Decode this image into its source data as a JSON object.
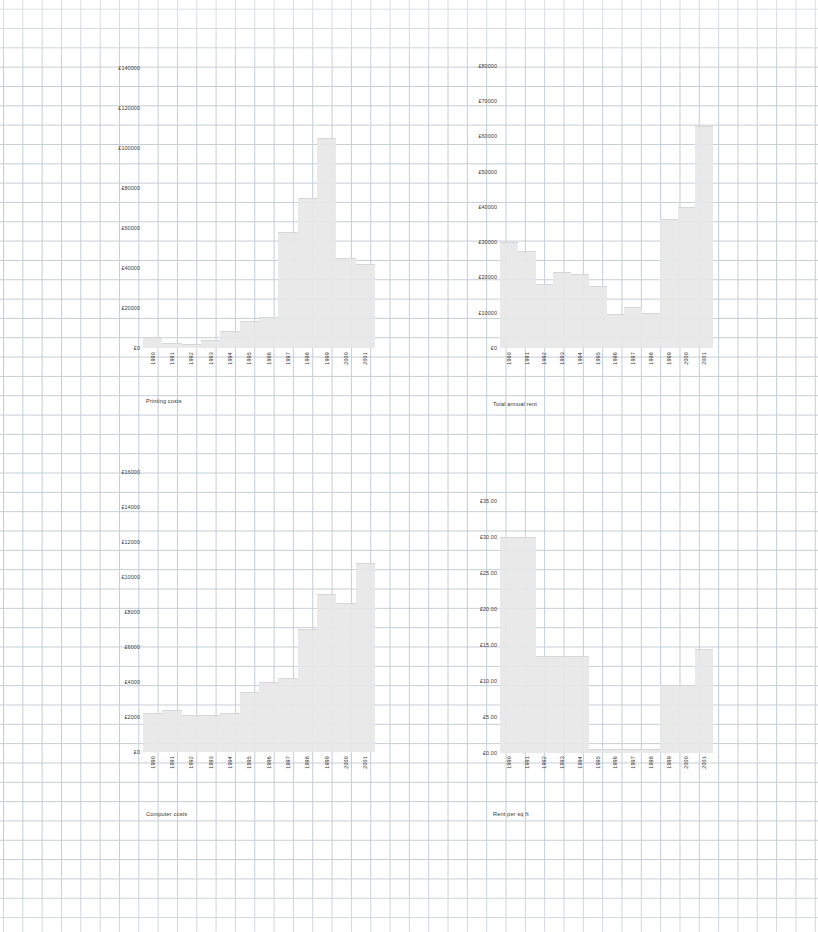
{
  "page": {
    "background": "#ffffff",
    "grid_color": "#b9c4cf",
    "bar_fill": "#e8e8e8",
    "bar_stroke": "#d4d4d4",
    "text_color": "#3a3a3a"
  },
  "charts": [
    {
      "id": "printing-costs",
      "caption": "Printing costs",
      "type": "bar",
      "title": "Printing costs",
      "xlabel": "",
      "ylabel": "",
      "ylim": [
        0,
        150000
      ],
      "ytick_values": [
        0,
        20000,
        40000,
        60000,
        80000,
        100000,
        120000,
        140000
      ],
      "ytick_labels": [
        "£0",
        "£20000",
        "£40000",
        "£60000",
        "£80000",
        "£100000",
        "£120000",
        "£140000"
      ],
      "categories": [
        "1990",
        "1991",
        "1992",
        "1993",
        "1994",
        "1995",
        "1996",
        "1997",
        "1998",
        "1999",
        "2000",
        "2001"
      ],
      "values": [
        5500,
        2600,
        1800,
        4200,
        8500,
        13500,
        15500,
        58000,
        75000,
        105000,
        45000,
        42000
      ],
      "grid": true,
      "legend": "none"
    },
    {
      "id": "total-annual-rent",
      "caption": "Total annual rent",
      "type": "bar",
      "title": "Total annual rent",
      "xlabel": "",
      "ylabel": "",
      "ylim": [
        0,
        85000
      ],
      "ytick_values": [
        0,
        10000,
        20000,
        30000,
        40000,
        50000,
        60000,
        70000,
        80000
      ],
      "ytick_labels": [
        "£0",
        "£10000",
        "£20000",
        "£30000",
        "£40000",
        "£50000",
        "£60000",
        "£70000",
        "£80000"
      ],
      "categories": [
        "1990",
        "1991",
        "1992",
        "1993",
        "1994",
        "1995",
        "1996",
        "1997",
        "1998",
        "1999",
        "2000",
        "2001"
      ],
      "values": [
        30000,
        27500,
        18000,
        21500,
        21000,
        17500,
        9500,
        11500,
        10000,
        36500,
        40000,
        63000
      ],
      "grid": true,
      "legend": "none"
    },
    {
      "id": "computer-costs",
      "caption": "Computer costs",
      "type": "bar",
      "title": "Computer costs",
      "xlabel": "",
      "ylabel": "",
      "ylim": [
        0,
        17000
      ],
      "ytick_values": [
        0,
        2000,
        4000,
        6000,
        8000,
        10000,
        12000,
        14000,
        16000
      ],
      "ytick_labels": [
        "£0",
        "£2000",
        "£4000",
        "£6000",
        "£8000",
        "£10000",
        "£12000",
        "£14000",
        "£16000"
      ],
      "categories": [
        "1990",
        "1991",
        "1992",
        "1993",
        "1994",
        "1995",
        "1996",
        "1997",
        "1998",
        "1999",
        "2000",
        "2001"
      ],
      "values": [
        2200,
        2400,
        2100,
        2100,
        2250,
        3400,
        4000,
        4200,
        7000,
        9000,
        8500,
        10800
      ],
      "grid": true,
      "legend": "none"
    },
    {
      "id": "rent-per-sq-ft",
      "caption": "Rent per sq ft",
      "type": "bar",
      "title": "Rent per sq ft",
      "xlabel": "",
      "ylabel": "",
      "ylim": [
        0,
        37.5
      ],
      "ytick_values": [
        0,
        5,
        10,
        15,
        20,
        25,
        30,
        35
      ],
      "ytick_labels": [
        "£0.00",
        "£5.00",
        "£10.00",
        "£15.00",
        "£20.00",
        "£25.00",
        "£30.00",
        "£35.00"
      ],
      "categories": [
        "1990",
        "1991",
        "1992",
        "1993",
        "1994",
        "1995",
        "1996",
        "1997",
        "1998",
        "1999",
        "2000",
        "2001"
      ],
      "values": [
        30.0,
        30.0,
        13.5,
        13.5,
        13.5,
        0.6,
        0.6,
        0.6,
        0.6,
        9.5,
        9.5,
        14.5
      ],
      "grid": true,
      "legend": "none"
    }
  ],
  "chart_data": [
    {
      "type": "bar",
      "title": "Printing costs",
      "xlabel": "",
      "ylabel": "",
      "ylim": [
        0,
        150000
      ],
      "categories": [
        "1990",
        "1991",
        "1992",
        "1993",
        "1994",
        "1995",
        "1996",
        "1997",
        "1998",
        "1999",
        "2000",
        "2001"
      ],
      "values": [
        5500,
        2600,
        1800,
        4200,
        8500,
        13500,
        15500,
        58000,
        75000,
        105000,
        45000,
        42000
      ],
      "ytick_labels": [
        "£0",
        "£20000",
        "£40000",
        "£60000",
        "£80000",
        "£100000",
        "£120000",
        "£140000"
      ],
      "grid": true,
      "legend": "none"
    },
    {
      "type": "bar",
      "title": "Total annual rent",
      "xlabel": "",
      "ylabel": "",
      "ylim": [
        0,
        85000
      ],
      "categories": [
        "1990",
        "1991",
        "1992",
        "1993",
        "1994",
        "1995",
        "1996",
        "1997",
        "1998",
        "1999",
        "2000",
        "2001"
      ],
      "values": [
        30000,
        27500,
        18000,
        21500,
        21000,
        17500,
        9500,
        11500,
        10000,
        36500,
        40000,
        63000
      ],
      "ytick_labels": [
        "£0",
        "£10000",
        "£20000",
        "£30000",
        "£40000",
        "£50000",
        "£60000",
        "£70000",
        "£80000"
      ],
      "grid": true,
      "legend": "none"
    },
    {
      "type": "bar",
      "title": "Computer costs",
      "xlabel": "",
      "ylabel": "",
      "ylim": [
        0,
        17000
      ],
      "categories": [
        "1990",
        "1991",
        "1992",
        "1993",
        "1994",
        "1995",
        "1996",
        "1997",
        "1998",
        "1999",
        "2000",
        "2001"
      ],
      "values": [
        2200,
        2400,
        2100,
        2100,
        2250,
        3400,
        4000,
        4200,
        7000,
        9000,
        8500,
        10800
      ],
      "ytick_labels": [
        "£0",
        "£2000",
        "£4000",
        "£6000",
        "£8000",
        "£10000",
        "£12000",
        "£14000",
        "£16000"
      ],
      "grid": true,
      "legend": "none"
    },
    {
      "type": "bar",
      "title": "Rent per sq ft",
      "xlabel": "",
      "ylabel": "",
      "ylim": [
        0,
        37.5
      ],
      "categories": [
        "1990",
        "1991",
        "1992",
        "1993",
        "1994",
        "1995",
        "1996",
        "1997",
        "1998",
        "1999",
        "2000",
        "2001"
      ],
      "values": [
        30.0,
        30.0,
        13.5,
        13.5,
        13.5,
        0.6,
        0.6,
        0.6,
        0.6,
        9.5,
        9.5,
        14.5
      ],
      "ytick_labels": [
        "£0.00",
        "£5.00",
        "£10.00",
        "£15.00",
        "£20.00",
        "£25.00",
        "£30.00",
        "£35.00"
      ],
      "grid": true,
      "legend": "none"
    }
  ]
}
